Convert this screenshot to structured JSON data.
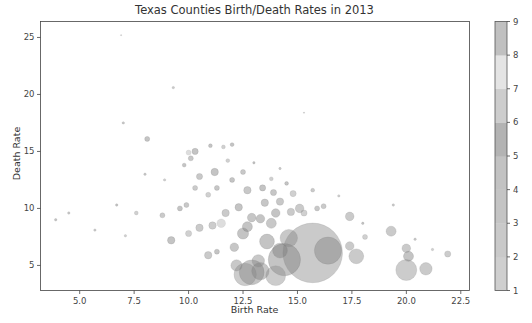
{
  "chart_data": {
    "type": "scatter",
    "title": "Texas Counties Birth/Death Rates in 2013",
    "xlabel": "Birth Rate",
    "ylabel": "Death Rate",
    "xlim": [
      3.2,
      22.9
    ],
    "ylim": [
      2.8,
      26.4
    ],
    "xticks": [
      5.0,
      7.5,
      10.0,
      12.5,
      15.0,
      17.5,
      20.0,
      22.5
    ],
    "xtick_labels": [
      "5.0",
      "7.5",
      "10.0",
      "12.5",
      "15.0",
      "17.5",
      "20.0",
      "22.5"
    ],
    "yticks": [
      5,
      10,
      15,
      20,
      25
    ],
    "ytick_labels": [
      "5",
      "10",
      "15",
      "20",
      "25"
    ],
    "grid": false,
    "colorbar": {
      "ticks": [
        1,
        2,
        3,
        4,
        5,
        6,
        7,
        8,
        9
      ],
      "tick_labels": [
        "1",
        "2",
        "3",
        "4",
        "5",
        "6",
        "7",
        "8",
        "9"
      ],
      "range": [
        1,
        9
      ],
      "bands": [
        "#cfcfcf",
        "#c9c9c9",
        "#c4c4c4",
        "#c2c2c2",
        "#b3b3b3",
        "#cdcdcd",
        "#e4e4e4",
        "#c0c0c0"
      ]
    },
    "marker_alpha": 0.45,
    "size_encoding": "population (bubble area)",
    "color_encoding": "region code 1-9",
    "points": [
      {
        "x": 15.7,
        "y": 6.1,
        "s": 48,
        "c": 3
      },
      {
        "x": 16.4,
        "y": 6.3,
        "s": 22,
        "c": 8
      },
      {
        "x": 14.4,
        "y": 5.5,
        "s": 26,
        "c": 5
      },
      {
        "x": 12.9,
        "y": 4.4,
        "s": 20,
        "c": 5
      },
      {
        "x": 12.6,
        "y": 4.2,
        "s": 18,
        "c": 2
      },
      {
        "x": 13.3,
        "y": 4.5,
        "s": 14,
        "c": 8
      },
      {
        "x": 14.0,
        "y": 4.1,
        "s": 16,
        "c": 2
      },
      {
        "x": 14.2,
        "y": 6.3,
        "s": 12,
        "c": 5
      },
      {
        "x": 14.6,
        "y": 7.4,
        "s": 14,
        "c": 4
      },
      {
        "x": 13.6,
        "y": 7.1,
        "s": 12,
        "c": 5
      },
      {
        "x": 13.2,
        "y": 5.4,
        "s": 10,
        "c": 4
      },
      {
        "x": 12.5,
        "y": 7.8,
        "s": 9,
        "c": 5
      },
      {
        "x": 12.1,
        "y": 6.6,
        "s": 7,
        "c": 8
      },
      {
        "x": 12.2,
        "y": 5.0,
        "s": 9,
        "c": 4
      },
      {
        "x": 12.7,
        "y": 8.4,
        "s": 8,
        "c": 5
      },
      {
        "x": 12.9,
        "y": 9.2,
        "s": 7,
        "c": 8
      },
      {
        "x": 13.3,
        "y": 9.1,
        "s": 7,
        "c": 5
      },
      {
        "x": 13.8,
        "y": 8.7,
        "s": 8,
        "c": 4
      },
      {
        "x": 14.0,
        "y": 9.6,
        "s": 7,
        "c": 5
      },
      {
        "x": 13.5,
        "y": 10.5,
        "s": 6,
        "c": 8
      },
      {
        "x": 14.2,
        "y": 10.6,
        "s": 6,
        "c": 4
      },
      {
        "x": 14.7,
        "y": 9.7,
        "s": 6,
        "c": 3
      },
      {
        "x": 15.1,
        "y": 10.0,
        "s": 7,
        "c": 3
      },
      {
        "x": 15.3,
        "y": 9.6,
        "s": 5,
        "c": 6
      },
      {
        "x": 15.9,
        "y": 10.0,
        "s": 4,
        "c": 4
      },
      {
        "x": 14.8,
        "y": 11.3,
        "s": 5,
        "c": 6
      },
      {
        "x": 13.9,
        "y": 11.4,
        "s": 5,
        "c": 8
      },
      {
        "x": 13.4,
        "y": 11.8,
        "s": 5,
        "c": 5
      },
      {
        "x": 12.7,
        "y": 11.6,
        "s": 6,
        "c": 4
      },
      {
        "x": 12.3,
        "y": 10.1,
        "s": 6,
        "c": 5
      },
      {
        "x": 11.7,
        "y": 9.6,
        "s": 6,
        "c": 3
      },
      {
        "x": 11.5,
        "y": 8.7,
        "s": 7,
        "c": 7
      },
      {
        "x": 11.1,
        "y": 8.5,
        "s": 6,
        "c": 2
      },
      {
        "x": 10.5,
        "y": 8.3,
        "s": 6,
        "c": 3
      },
      {
        "x": 10.0,
        "y": 7.8,
        "s": 5,
        "c": 6
      },
      {
        "x": 9.2,
        "y": 7.2,
        "s": 6,
        "c": 5
      },
      {
        "x": 10.9,
        "y": 5.9,
        "s": 6,
        "c": 3
      },
      {
        "x": 11.3,
        "y": 6.2,
        "s": 4,
        "c": 5
      },
      {
        "x": 17.4,
        "y": 9.3,
        "s": 7,
        "c": 3
      },
      {
        "x": 19.3,
        "y": 8.0,
        "s": 8,
        "c": 3
      },
      {
        "x": 18.1,
        "y": 7.5,
        "s": 4,
        "c": 6
      },
      {
        "x": 17.7,
        "y": 5.8,
        "s": 12,
        "c": 3
      },
      {
        "x": 17.4,
        "y": 6.7,
        "s": 7,
        "c": 3
      },
      {
        "x": 20.0,
        "y": 4.6,
        "s": 17,
        "c": 2
      },
      {
        "x": 20.1,
        "y": 5.8,
        "s": 8,
        "c": 5
      },
      {
        "x": 20.0,
        "y": 6.5,
        "s": 7,
        "c": 3
      },
      {
        "x": 20.9,
        "y": 4.7,
        "s": 10,
        "c": 3
      },
      {
        "x": 21.9,
        "y": 6.0,
        "s": 5,
        "c": 2
      },
      {
        "x": 16.2,
        "y": 10.2,
        "s": 4,
        "c": 3
      },
      {
        "x": 11.2,
        "y": 13.2,
        "s": 6,
        "c": 5
      },
      {
        "x": 10.5,
        "y": 12.8,
        "s": 5,
        "c": 4
      },
      {
        "x": 10.9,
        "y": 11.2,
        "s": 4,
        "c": 6
      },
      {
        "x": 10.3,
        "y": 11.8,
        "s": 4,
        "c": 3
      },
      {
        "x": 9.6,
        "y": 10.0,
        "s": 4,
        "c": 5
      },
      {
        "x": 9.9,
        "y": 10.3,
        "s": 4,
        "c": 4
      },
      {
        "x": 8.8,
        "y": 9.4,
        "s": 4,
        "c": 3
      },
      {
        "x": 7.6,
        "y": 9.6,
        "s": 3,
        "c": 6
      },
      {
        "x": 6.7,
        "y": 10.3,
        "s": 2,
        "c": 5
      },
      {
        "x": 4.5,
        "y": 9.6,
        "s": 2,
        "c": 3
      },
      {
        "x": 3.9,
        "y": 9.0,
        "s": 2,
        "c": 5
      },
      {
        "x": 5.7,
        "y": 8.1,
        "s": 2,
        "c": 3
      },
      {
        "x": 7.1,
        "y": 7.6,
        "s": 2,
        "c": 6
      },
      {
        "x": 8.1,
        "y": 16.1,
        "s": 4,
        "c": 5
      },
      {
        "x": 7.0,
        "y": 17.5,
        "s": 2,
        "c": 4
      },
      {
        "x": 9.3,
        "y": 20.6,
        "s": 2,
        "c": 3
      },
      {
        "x": 6.9,
        "y": 25.2,
        "s": 1,
        "c": 6
      },
      {
        "x": 10.0,
        "y": 14.9,
        "s": 4,
        "c": 7
      },
      {
        "x": 10.3,
        "y": 15.0,
        "s": 5,
        "c": 5
      },
      {
        "x": 10.1,
        "y": 14.4,
        "s": 4,
        "c": 4
      },
      {
        "x": 11.0,
        "y": 15.5,
        "s": 3,
        "c": 5
      },
      {
        "x": 11.6,
        "y": 15.4,
        "s": 3,
        "c": 6
      },
      {
        "x": 12.0,
        "y": 15.6,
        "s": 3,
        "c": 5
      },
      {
        "x": 12.5,
        "y": 13.2,
        "s": 4,
        "c": 4
      },
      {
        "x": 13.8,
        "y": 12.6,
        "s": 3,
        "c": 6
      },
      {
        "x": 14.5,
        "y": 12.2,
        "s": 3,
        "c": 5
      },
      {
        "x": 12.0,
        "y": 12.5,
        "s": 4,
        "c": 5
      },
      {
        "x": 11.3,
        "y": 11.8,
        "s": 4,
        "c": 8
      },
      {
        "x": 15.7,
        "y": 11.6,
        "s": 3,
        "c": 3
      },
      {
        "x": 16.9,
        "y": 11.1,
        "s": 2,
        "c": 6
      },
      {
        "x": 15.3,
        "y": 18.4,
        "s": 1,
        "c": 3
      },
      {
        "x": 19.4,
        "y": 10.3,
        "s": 2,
        "c": 3
      },
      {
        "x": 18.0,
        "y": 8.7,
        "s": 2,
        "c": 5
      },
      {
        "x": 20.4,
        "y": 7.3,
        "s": 2,
        "c": 3
      },
      {
        "x": 21.2,
        "y": 6.4,
        "s": 2,
        "c": 6
      },
      {
        "x": 9.8,
        "y": 13.8,
        "s": 3,
        "c": 5
      },
      {
        "x": 8.9,
        "y": 12.5,
        "s": 2,
        "c": 6
      },
      {
        "x": 8.0,
        "y": 13.0,
        "s": 2,
        "c": 3
      },
      {
        "x": 11.8,
        "y": 14.2,
        "s": 3,
        "c": 6
      },
      {
        "x": 13.0,
        "y": 14.0,
        "s": 2,
        "c": 5
      },
      {
        "x": 14.2,
        "y": 13.5,
        "s": 2,
        "c": 3
      }
    ]
  }
}
